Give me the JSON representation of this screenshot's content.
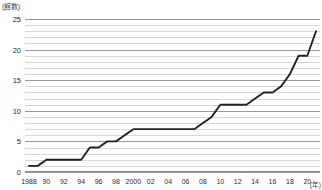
{
  "chart_data": {
    "type": "line",
    "title": "",
    "subtitle": "",
    "ylabel": "(館数)",
    "xlabel": "(年)",
    "ylim": [
      0,
      25
    ],
    "yticks": [
      0,
      5,
      10,
      15,
      20,
      25
    ],
    "grid": true,
    "grid_step": 1,
    "legend": "none",
    "xtick_labels": [
      "1988",
      "90",
      "92",
      "94",
      "96",
      "98",
      "2000",
      "02",
      "04",
      "06",
      "08",
      "10",
      "12",
      "14",
      "16",
      "18",
      "20"
    ],
    "x": [
      1988,
      1989,
      1990,
      1991,
      1992,
      1993,
      1994,
      1995,
      1996,
      1997,
      1998,
      1999,
      2000,
      2001,
      2002,
      2003,
      2004,
      2005,
      2006,
      2007,
      2008,
      2009,
      2010,
      2011,
      2012,
      2013,
      2014,
      2015,
      2016,
      2017,
      2018,
      2019,
      2020,
      2021
    ],
    "series": [
      {
        "name": "館数",
        "values": [
          1,
          1,
          2,
          2,
          2,
          2,
          2,
          4,
          4,
          5,
          5,
          6,
          7,
          7,
          7,
          7,
          7,
          7,
          7,
          7,
          8,
          9,
          11,
          11,
          11,
          11,
          12,
          13,
          13,
          14,
          16,
          19,
          19,
          23
        ]
      }
    ]
  },
  "axes": {
    "y_unit_label": "(館数)",
    "x_unit_label": "(年)"
  }
}
